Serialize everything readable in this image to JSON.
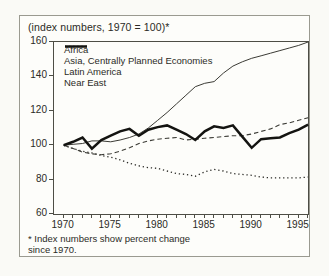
{
  "figure": {
    "title": "(index numbers, 1970 = 100)*",
    "footnote_line1": "* Index numbers show percent change",
    "footnote_line2": "since 1970."
  },
  "chart_data": {
    "type": "line",
    "title": "(index numbers, 1970 = 100)*",
    "footnote": "* Index numbers show percent change since 1970.",
    "grid": false,
    "legend_position": "top-left-inside",
    "ylim": [
      60,
      160
    ],
    "yticks": [
      60,
      80,
      100,
      120,
      140,
      160
    ],
    "xticks_labeled": [
      1970,
      1975,
      1980,
      1985,
      1990,
      1995
    ],
    "x": [
      1970,
      1971,
      1972,
      1973,
      1974,
      1975,
      1976,
      1977,
      1978,
      1979,
      1980,
      1981,
      1982,
      1983,
      1984,
      1985,
      1986,
      1987,
      1988,
      1989,
      1990,
      1991,
      1992,
      1993,
      1994,
      1995,
      1996
    ],
    "series": [
      {
        "id": "africa",
        "name": "Africa",
        "line_style": "dotted",
        "values": [
          100,
          98,
          96.5,
          95.5,
          94,
          93,
          91.5,
          89.5,
          88,
          87,
          86.5,
          85,
          83.5,
          83,
          82,
          84.5,
          86,
          85,
          83.5,
          83,
          82.5,
          81.5,
          81,
          81,
          81,
          81,
          81.5
        ]
      },
      {
        "id": "asia-cpe",
        "name": "Asia, Centrally Planned Economies",
        "line_style": "thin-solid",
        "values": [
          100,
          100.5,
          101,
          102.5,
          102.5,
          102,
          103,
          104.5,
          106.5,
          110,
          114.5,
          119,
          124,
          129,
          134,
          136,
          137,
          142,
          146,
          148.5,
          150.5,
          152,
          153.5,
          155,
          156.5,
          158,
          160
        ]
      },
      {
        "id": "latin-america",
        "name": "Latin America",
        "line_style": "dashed",
        "values": [
          100,
          98,
          96,
          95,
          94.5,
          95,
          96.5,
          98.5,
          101,
          102.5,
          103.5,
          104,
          104.5,
          103,
          103.5,
          104,
          104.5,
          105,
          105.5,
          105.5,
          106.5,
          108,
          109.5,
          112,
          113,
          114.5,
          116
        ]
      },
      {
        "id": "near-east",
        "name": "Near East",
        "line_style": "thick-solid",
        "values": [
          100,
          102,
          104.5,
          98,
          103,
          105.5,
          108,
          109.5,
          105.5,
          109,
          110.5,
          111.5,
          109,
          106.5,
          103,
          108,
          111,
          110,
          111.5,
          105,
          98.5,
          103.5,
          104,
          104.5,
          107,
          109,
          112
        ]
      }
    ]
  }
}
